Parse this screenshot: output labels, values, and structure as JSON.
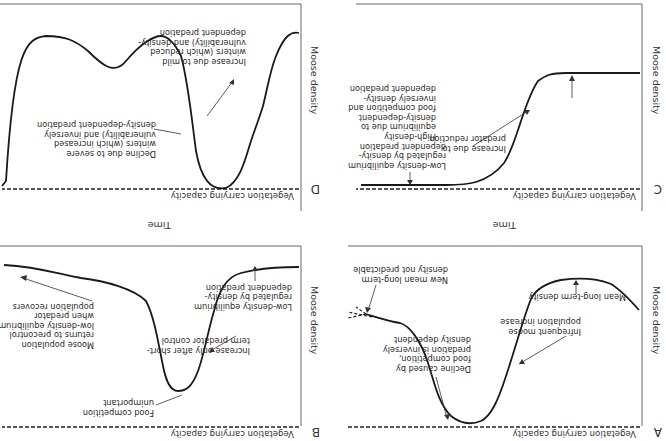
{
  "figure": {
    "orientation": "rotated 180 degrees",
    "panels": [
      {
        "id": "A",
        "letter": "A",
        "y_axis_label": "Moose density",
        "x_axis_label": "Time",
        "baseline_label": "Vegetation carrying capacity",
        "annotations": [
          "Infrequent moose\npopulation increase",
          "Mean long-term density",
          "Decline caused by\nfood competition,\npredation is inversely\ndensity dependent",
          "New mean long-term\ndensity not predictable"
        ]
      },
      {
        "id": "B",
        "letter": "B",
        "y_axis_label": "Moose density",
        "x_axis_label": "Time",
        "baseline_label": "Vegetation carrying capacity",
        "annotations": [
          "Low-density equilibrium\nregulated by density-\ndependent predation",
          "Increase only after short-\nterm predator control",
          "Food competition\nunimportant",
          "Moose population\nreturns to precontrol\nlow-density equilibrium\nwhen predator\npopulation recovers"
        ]
      },
      {
        "id": "C",
        "letter": "C",
        "y_axis_label": "Moose density",
        "x_axis_label": "",
        "baseline_label": "Vegetation carrying capacity",
        "annotations": [
          "Low-density equilibrium\nregulated by density-\ndependent predation",
          "Increase due to\npredator reduction",
          "High-density\nequilibrium due to\ndensity-dependent\nfood competition and\ninversely density-\ndependent predation"
        ]
      },
      {
        "id": "D",
        "letter": "D",
        "y_axis_label": "Moose density",
        "x_axis_label": "",
        "baseline_label": "Vegetation carrying capacity",
        "annotations": [
          "Increase due to mild\nwinters (which reduced\nvulnerability) and density-\ndependent predation",
          "Decline due to severe\nwinters (which increased\nvulnerability) and inversely\ndensity-dependent predation"
        ]
      }
    ]
  },
  "colors": {
    "line": "#1a1a1a",
    "axis": "#555555",
    "text": "#2a2a2a"
  }
}
